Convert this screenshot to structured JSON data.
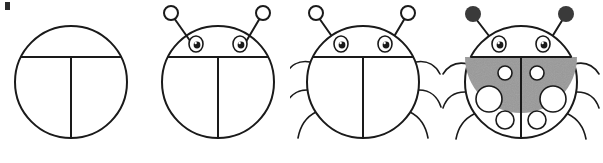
{
  "figure": {
    "kind": "step-by-step-drawing-tutorial",
    "panel_count": 4,
    "background_color": "#ffffff",
    "ink_color": "#1a1a1a",
    "shading_color": "#9a9a9a",
    "spot_fill_color": "#ffffff",
    "corner_mark_color": "#2b2b2b"
  },
  "panels": [
    {
      "step_number": 1,
      "name": "body-outline",
      "description": "Plain circle divided by a horizontal chord near the top and a vertical center line below it",
      "features": [
        "body-circle",
        "head-divider-line",
        "wing-split-line"
      ],
      "has_antennae": false,
      "has_eyes": false,
      "has_legs": false,
      "has_shading": false,
      "has_spots": false
    },
    {
      "step_number": 2,
      "name": "add-head-and-antennae",
      "description": "Same circle with two eyes on the head band and two antennae with open circle tips",
      "features": [
        "body-circle",
        "head-divider-line",
        "wing-split-line",
        "left-eye",
        "right-eye",
        "left-antenna",
        "right-antenna"
      ],
      "has_antennae": true,
      "antenna_tip_style": "open-circle",
      "has_eyes": true,
      "eye_count": 2,
      "has_legs": false,
      "has_shading": false,
      "has_spots": false
    },
    {
      "step_number": 3,
      "name": "add-legs",
      "description": "Ladybug outline with three curved legs added on each side of the body",
      "features": [
        "body-circle",
        "head-divider-line",
        "wing-split-line",
        "left-eye",
        "right-eye",
        "left-antenna",
        "right-antenna",
        "left-legs",
        "right-legs"
      ],
      "has_antennae": true,
      "antenna_tip_style": "open-circle",
      "has_eyes": true,
      "eye_count": 2,
      "has_legs": true,
      "legs_per_side": 3,
      "has_shading": false,
      "has_spots": false
    },
    {
      "step_number": 4,
      "name": "shade-and-add-spots",
      "description": "Finished ladybug with grey shaded wings, six white spots, and solid filled antenna tips",
      "features": [
        "body-circle",
        "head-divider-line",
        "wing-split-line",
        "left-eye",
        "right-eye",
        "left-antenna",
        "right-antenna",
        "left-legs",
        "right-legs",
        "wing-shading",
        "wing-spots"
      ],
      "has_antennae": true,
      "antenna_tip_style": "filled-circle",
      "has_eyes": true,
      "eye_count": 2,
      "has_legs": true,
      "legs_per_side": 3,
      "has_shading": true,
      "has_spots": true,
      "spot_count": 6,
      "spots_per_wing": 3
    }
  ]
}
